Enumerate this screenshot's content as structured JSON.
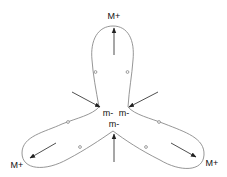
{
  "diagram": {
    "labels": {
      "top_max": "M+",
      "bottom_left_max": "M+",
      "bottom_right_max": "M+",
      "left_min": "m-",
      "right_min": "m-",
      "bottom_min": "m-"
    },
    "colors": {
      "curve": "#8a8a8a",
      "arrow": "#222222",
      "text": "#111111",
      "background": "#ffffff"
    }
  }
}
